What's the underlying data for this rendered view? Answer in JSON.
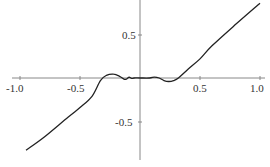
{
  "chart_data": {
    "type": "line",
    "title": "",
    "xlabel": "",
    "ylabel": "",
    "xlim": [
      -1.0,
      1.0
    ],
    "ylim": [
      -0.9,
      0.95
    ],
    "grid": false,
    "legend": null,
    "x_ticks": [
      "-1.0",
      "-0.5",
      "0.5",
      "1.0"
    ],
    "y_ticks": [
      "0.5",
      "-0.5"
    ],
    "series": [
      {
        "name": "f(x)",
        "color": "#222222",
        "x": [
          -0.95,
          -0.8,
          -0.6,
          -0.5,
          -0.4,
          -0.33,
          -0.28,
          -0.22,
          -0.17,
          -0.13,
          -0.11,
          -0.09,
          -0.07,
          -0.05,
          0.0,
          0.08,
          0.12,
          0.16,
          0.2,
          0.24,
          0.28,
          0.32,
          0.4,
          0.5,
          0.6,
          0.8,
          1.0
        ],
        "y": [
          -0.83,
          -0.68,
          -0.45,
          -0.34,
          -0.21,
          -0.03,
          0.03,
          0.045,
          0.02,
          -0.015,
          -0.01,
          0.01,
          -0.005,
          0.0,
          0.0,
          0.0,
          0.01,
          0.0,
          -0.03,
          -0.04,
          -0.03,
          0.0,
          0.1,
          0.22,
          0.37,
          0.62,
          0.86
        ]
      }
    ]
  },
  "axes": {
    "x_origin_px": 140,
    "y_origin_px": 78,
    "x_scale_px_per_unit": 120,
    "y_scale_px_per_unit": 87
  }
}
